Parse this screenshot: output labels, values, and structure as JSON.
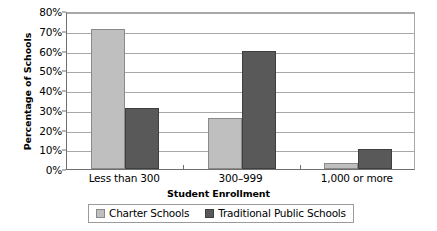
{
  "chart_data": {
    "type": "bar",
    "title": "",
    "subtitle": "",
    "xlabel": "Student Enrollment",
    "ylabel": "Percentage of Schools",
    "categories": [
      "Less than 300",
      "300–999",
      "1,000 or more"
    ],
    "series": [
      {
        "name": "Charter Schools",
        "values": [
          71,
          26,
          3
        ],
        "color": "#bfbfbf"
      },
      {
        "name": "Traditional Public Schools",
        "values": [
          31,
          60,
          10
        ],
        "color": "#595959"
      }
    ],
    "ylim": [
      0,
      80
    ],
    "ytick_step": 10,
    "ytick_labels": [
      "80%",
      "70%",
      "60%",
      "50%",
      "40%",
      "30%",
      "20%",
      "10%",
      "0%"
    ],
    "ytick_values": [
      80,
      70,
      60,
      50,
      40,
      30,
      20,
      10,
      0
    ],
    "grid": true,
    "grid_axis": "y",
    "legend_position": "bottom",
    "value_format": "percent"
  },
  "colors": {
    "charter": "#bfbfbf",
    "traditional": "#595959",
    "gridline": "#a8a8a8",
    "axis": "#6f6f6f",
    "text": "#000000",
    "background": "#ffffff"
  }
}
